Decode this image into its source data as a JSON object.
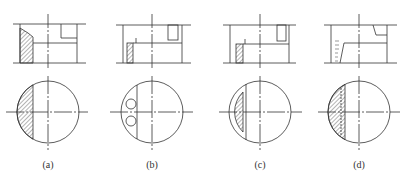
{
  "figure": {
    "panels": [
      {
        "id": "a",
        "label": "(a)",
        "cx": 48
      },
      {
        "id": "b",
        "label": "(b)",
        "cx": 152
      },
      {
        "id": "c",
        "label": "(c)",
        "cx": 260
      },
      {
        "id": "d",
        "label": "(d)",
        "cx": 359
      }
    ],
    "line_color": "#333333",
    "hatch_color": "#444444"
  }
}
